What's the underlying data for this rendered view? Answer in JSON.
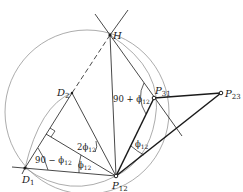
{
  "diagram": {
    "points": {
      "H": {
        "label": "H",
        "x": 110,
        "y": 35
      },
      "D1": {
        "label": "D",
        "sub": "1",
        "x": 25,
        "y": 168
      },
      "D2": {
        "label": "D",
        "sub": "2",
        "x": 72,
        "y": 93
      },
      "P12": {
        "label": "P",
        "sub": "12",
        "x": 116,
        "y": 176
      },
      "P31": {
        "label": "P",
        "sub": "31",
        "x": 154,
        "y": 98
      },
      "P23": {
        "label": "P",
        "sub": "23",
        "x": 221,
        "y": 93
      }
    },
    "angle_labels": {
      "a1": {
        "prefix": "90 + ",
        "phi": "ϕ",
        "sub": "12"
      },
      "a2": {
        "prefix": "2",
        "phi": "ϕ",
        "sub": "12"
      },
      "a3": {
        "prefix": "90 − ",
        "phi": "ϕ",
        "sub": "12"
      },
      "a4": {
        "prefix": "",
        "phi": "ϕ",
        "sub": "12"
      },
      "a5": {
        "prefix": "",
        "phi": "ϕ",
        "sub": "12"
      }
    },
    "colors": {
      "line": "#1a1a1a",
      "circle": "#777777"
    }
  }
}
